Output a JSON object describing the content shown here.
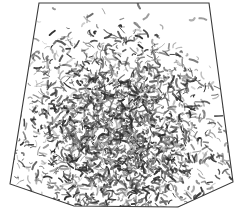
{
  "figure": {
    "domain": "Natural-Image",
    "kind": "scanned-grayscale-figure",
    "title": "Scattered fibrous texture within trapezoidal frame",
    "canvas": {
      "width": 244,
      "height": 212
    },
    "background_color": "#ffffff",
    "outline": {
      "name": "trapezoid-frame",
      "stroke_color": "#3a3a3a",
      "stroke_width": 1.1,
      "fill_color": "none",
      "vertices": [
        {
          "label": "top-left",
          "x": 39,
          "y": 3
        },
        {
          "label": "top-right",
          "x": 209,
          "y": 3
        },
        {
          "label": "right-lower",
          "x": 233,
          "y": 182
        },
        {
          "label": "bottom-right",
          "x": 178,
          "y": 207
        },
        {
          "label": "bottom-left",
          "x": 74,
          "y": 206
        },
        {
          "label": "left-lower",
          "x": 10,
          "y": 184
        }
      ]
    },
    "texture": {
      "name": "squiggle-field",
      "mark_color_dark": "#2e2e2e",
      "mark_color_mid": "#6b6b6b",
      "mark_color_light": "#a8a8a8",
      "mark_count": 2600,
      "density_center": {
        "x": 0.48,
        "y": 0.62
      },
      "density_note": "Gaussian-like falloff from lower-center core; near-empty upper-right corner",
      "seed": 20240517
    }
  }
}
